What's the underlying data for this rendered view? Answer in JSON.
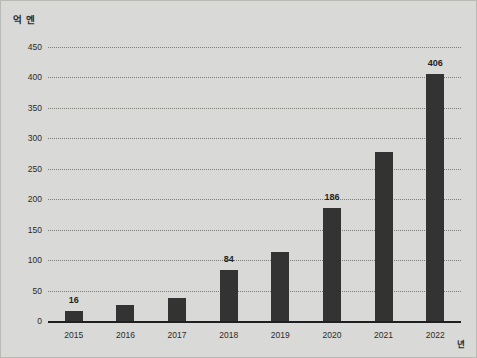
{
  "chart_data": {
    "type": "bar",
    "title": "",
    "subtitle": "",
    "xlabel": "년",
    "ylabel": "억 엔",
    "categories": [
      "2015",
      "2016",
      "2017",
      "2018",
      "2019",
      "2020",
      "2021",
      "2022"
    ],
    "values": [
      16,
      27,
      38,
      84,
      114,
      186,
      278,
      406
    ],
    "value_labels": [
      "16",
      "",
      "",
      "84",
      "",
      "186",
      "",
      "406"
    ],
    "point_labels_shown": [
      true,
      false,
      false,
      true,
      false,
      true,
      false,
      true
    ],
    "ylim": [
      0,
      450
    ],
    "ytick_labels": [
      "450",
      "400",
      "350",
      "300",
      "250",
      "200",
      "150",
      "100",
      "50",
      "0"
    ],
    "ytick_values": [
      450,
      400,
      350,
      300,
      250,
      200,
      150,
      100,
      50,
      0
    ],
    "ytick_step": 50,
    "grid": true,
    "grid_style": "dotted",
    "legend": false,
    "legend_position": "none",
    "bar_color": "#333333",
    "background_color": "#d9d9d7",
    "grid_color": "#7d7d7a",
    "axis_color": "#1f1f1f",
    "text_color": "#2b2b2b"
  }
}
